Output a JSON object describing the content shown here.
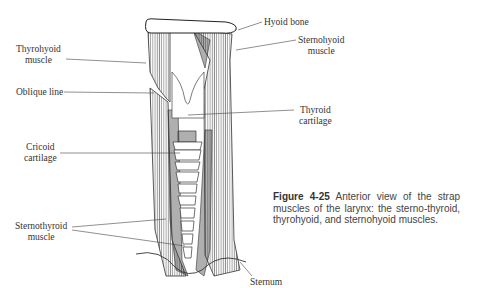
{
  "figure": {
    "labels": {
      "hyoid_bone": "Hyoid bone",
      "sternohyoid_1": "Sternohyoid",
      "sternohyoid_2": "muscle",
      "thyrohyoid_1": "Thyrohyoid",
      "thyrohyoid_2": "muscle",
      "oblique_line": "Oblique line",
      "thyroid_1": "Thyroid",
      "thyroid_2": "cartilage",
      "cricoid_1": "Cricoid",
      "cricoid_2": "cartilage",
      "sternothyroid_1": "Sternothyroid",
      "sternothyroid_2": "muscle",
      "sternum": "Sternum"
    },
    "caption": {
      "number": "Figure 4-25",
      "text": "Anterior view of the strap muscles of the larynx: the sterno-thyroid, thyrohyoid, and sternohyoid muscles."
    }
  }
}
